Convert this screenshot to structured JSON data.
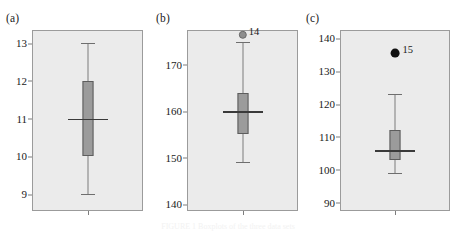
{
  "figure": {
    "width": 456,
    "height": 232,
    "background": "#ffffff",
    "panel_background": "#ebebeb",
    "box_fill": "#9b9b9b",
    "box_edge": "#5d5d5d",
    "whisker_color": "#7c7c7c",
    "median_color": "#3a3a3a",
    "caption": "FIGURE 1  Boxplots of the three data sets"
  },
  "chart_data": [
    {
      "type": "box",
      "panel": "(a)",
      "title": "",
      "xlabel": "",
      "ylabel": "",
      "ylim": [
        8.55,
        13.35
      ],
      "yticks": [
        13,
        12,
        11,
        10,
        9
      ],
      "ytick_labels": [
        "13",
        "12",
        "11",
        "10",
        "9"
      ],
      "grid": false,
      "boxes": [
        {
          "name": "box-a",
          "whisker_low": 9,
          "q1": 10,
          "median": 11,
          "q3": 12,
          "whisker_high": 13,
          "outliers": []
        }
      ]
    },
    {
      "type": "box",
      "panel": "(b)",
      "title": "",
      "xlabel": "",
      "ylabel": "",
      "ylim": [
        138.5,
        177.5
      ],
      "yticks": [
        170,
        160,
        150,
        140
      ],
      "ytick_labels": [
        "170",
        "160",
        "150",
        "140"
      ],
      "grid": false,
      "boxes": [
        {
          "name": "box-b",
          "whisker_low": 149,
          "q1": 155,
          "median": 160,
          "q3": 164,
          "whisker_high": 175,
          "outliers": [
            {
              "value": 176.5,
              "label": "14",
              "style": "open",
              "size": 3.2
            }
          ]
        }
      ]
    },
    {
      "type": "box",
      "panel": "(c)",
      "title": "",
      "xlabel": "",
      "ylabel": "",
      "ylim": [
        87.5,
        142.5
      ],
      "yticks": [
        140,
        130,
        120,
        110,
        100,
        90
      ],
      "ytick_labels": [
        "140",
        "130",
        "120",
        "110",
        "100",
        "90"
      ],
      "grid": false,
      "boxes": [
        {
          "name": "box-c",
          "whisker_low": 99,
          "q1": 103,
          "median": 106,
          "q3": 112,
          "whisker_high": 123,
          "outliers": [
            {
              "value": 135.5,
              "label": "15",
              "style": "filled",
              "size": 4.4
            }
          ]
        }
      ]
    }
  ],
  "panels": [
    {
      "label": "(a)",
      "label_x": 6,
      "frame_x": 32,
      "frame_w": 111
    },
    {
      "label": "(b)",
      "label_x": 156,
      "frame_x": 187,
      "frame_w": 111
    },
    {
      "label": "(c)",
      "label_x": 306,
      "frame_x": 340,
      "frame_w": 110
    }
  ]
}
